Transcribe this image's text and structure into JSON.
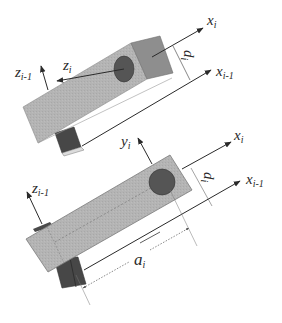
{
  "diagram": {
    "type": "Denavit-Hartenberg link parameters",
    "colors": {
      "link_body": "#b4b4b4",
      "link_end_face": "#8e8e8e",
      "joint_block": "#4a4a4a",
      "joint_circle": "#555555",
      "axis_line": "#2a2a2a",
      "background": "#ffffff"
    },
    "top_figure": {
      "description": "Link viewed showing offset d_i between x_{i-1} and x_i",
      "labels": {
        "x_i": {
          "base": "x",
          "sub": "i"
        },
        "x_im1": {
          "base": "x",
          "sub": "i-1"
        },
        "z_im1": {
          "base": "z",
          "sub": "i-1"
        },
        "z_i": {
          "base": "z",
          "sub": "i"
        },
        "d_i": {
          "base": "d",
          "sub": "i"
        }
      }
    },
    "bottom_figure": {
      "description": "Link viewed showing length a_i and offset d_i",
      "labels": {
        "x_i": {
          "base": "x",
          "sub": "i"
        },
        "x_im1": {
          "base": "x",
          "sub": "i-1"
        },
        "y_i": {
          "base": "y",
          "sub": "i"
        },
        "z_im1": {
          "base": "z",
          "sub": "i-1"
        },
        "d_i": {
          "base": "d",
          "sub": "i"
        },
        "a_i": {
          "base": "a",
          "sub": "i"
        }
      }
    }
  }
}
